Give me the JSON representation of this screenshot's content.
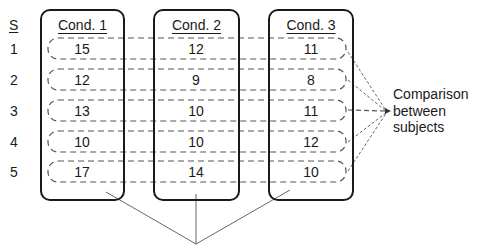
{
  "diagram": {
    "subject_header": "S",
    "subjects": [
      "1",
      "2",
      "3",
      "4",
      "5"
    ],
    "conditions": [
      {
        "title": "Cond. 1",
        "values": [
          "15",
          "12",
          "13",
          "10",
          "17"
        ]
      },
      {
        "title": "Cond. 2",
        "values": [
          "12",
          "9",
          "10",
          "10",
          "14"
        ]
      },
      {
        "title": "Cond. 3",
        "values": [
          "11",
          "8",
          "11",
          "12",
          "10"
        ]
      }
    ],
    "annotation_right": {
      "line1": "Comparison",
      "line2": "between",
      "line3": "subjects"
    },
    "colors": {
      "ink": "#1a1a1a",
      "dash": "#555555",
      "background": "#ffffff"
    }
  }
}
